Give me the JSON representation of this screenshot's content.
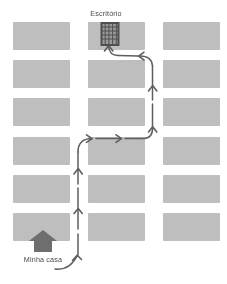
{
  "map": {
    "title": "Rota de casa para o escritório",
    "width": 227,
    "height": 284,
    "background_color": "#ffffff",
    "block_color": "#b9b9b9",
    "route_color": "#5e5e5e",
    "icon_color": "#6b6b6b"
  },
  "labels": {
    "destination": "Escritório",
    "origin": "Minha casa"
  },
  "icons": {
    "office": "office-building-icon",
    "home": "house-icon"
  },
  "grid": {
    "columns": 3,
    "rows": 6,
    "column_x": [
      13,
      88,
      163
    ],
    "row_y": [
      22,
      60,
      98,
      137,
      175,
      213
    ],
    "block_width": 57,
    "block_height": 28
  },
  "blocks": [
    {
      "row": 1,
      "col": 1,
      "x": 13,
      "y": 22,
      "w": 57,
      "h": 28
    },
    {
      "row": 1,
      "col": 2,
      "x": 88,
      "y": 22,
      "w": 57,
      "h": 28
    },
    {
      "row": 1,
      "col": 3,
      "x": 163,
      "y": 22,
      "w": 57,
      "h": 28
    },
    {
      "row": 2,
      "col": 1,
      "x": 13,
      "y": 60,
      "w": 57,
      "h": 28
    },
    {
      "row": 2,
      "col": 2,
      "x": 88,
      "y": 60,
      "w": 57,
      "h": 28
    },
    {
      "row": 2,
      "col": 3,
      "x": 163,
      "y": 60,
      "w": 57,
      "h": 28
    },
    {
      "row": 3,
      "col": 1,
      "x": 13,
      "y": 98,
      "w": 57,
      "h": 28
    },
    {
      "row": 3,
      "col": 2,
      "x": 88,
      "y": 98,
      "w": 57,
      "h": 28
    },
    {
      "row": 3,
      "col": 3,
      "x": 163,
      "y": 98,
      "w": 57,
      "h": 28
    },
    {
      "row": 4,
      "col": 1,
      "x": 13,
      "y": 137,
      "w": 57,
      "h": 28
    },
    {
      "row": 4,
      "col": 2,
      "x": 88,
      "y": 137,
      "w": 57,
      "h": 28
    },
    {
      "row": 4,
      "col": 3,
      "x": 163,
      "y": 137,
      "w": 57,
      "h": 28
    },
    {
      "row": 5,
      "col": 1,
      "x": 13,
      "y": 175,
      "w": 57,
      "h": 28
    },
    {
      "row": 5,
      "col": 2,
      "x": 88,
      "y": 175,
      "w": 57,
      "h": 28
    },
    {
      "row": 5,
      "col": 3,
      "x": 163,
      "y": 175,
      "w": 57,
      "h": 28
    },
    {
      "row": 6,
      "col": 1,
      "x": 13,
      "y": 213,
      "w": 57,
      "h": 28
    },
    {
      "row": 6,
      "col": 2,
      "x": 88,
      "y": 213,
      "w": 57,
      "h": 28
    },
    {
      "row": 6,
      "col": 3,
      "x": 163,
      "y": 213,
      "w": 57,
      "h": 28
    }
  ],
  "route": {
    "start": "Minha casa",
    "end": "Escritório",
    "style": "hand-drawn-arrow",
    "segments": [
      {
        "name": "start-curve",
        "direction": "up-right"
      },
      {
        "name": "left-vertical-up",
        "direction": "up"
      },
      {
        "name": "turn-right",
        "direction": "right"
      },
      {
        "name": "horizontal-right",
        "direction": "right"
      },
      {
        "name": "turn-up",
        "direction": "up"
      },
      {
        "name": "right-vertical-up",
        "direction": "up"
      },
      {
        "name": "turn-left",
        "direction": "left"
      },
      {
        "name": "final-arrival-up",
        "direction": "up"
      }
    ]
  }
}
